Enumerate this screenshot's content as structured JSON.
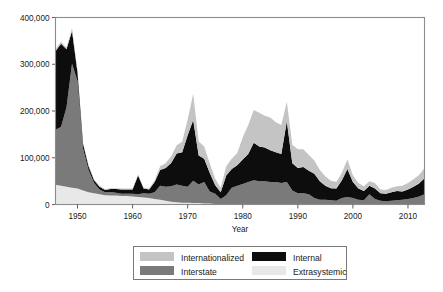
{
  "figure": {
    "background": "#ffffff",
    "width": 443,
    "height": 292
  },
  "chart_data": {
    "type": "area",
    "stacked": true,
    "title": "",
    "subtitle": "",
    "xlabel": "Year",
    "ylabel": "",
    "xlim": [
      1946,
      2013
    ],
    "ylim": [
      0,
      400000
    ],
    "grid": false,
    "legend_position": "bottom",
    "xticks": [
      1950,
      1960,
      1970,
      1980,
      1990,
      2000,
      2010
    ],
    "xtick_labels": [
      "1950",
      "1960",
      "1970",
      "1980",
      "1990",
      "2000",
      "2010"
    ],
    "yticks": [
      0,
      100000,
      200000,
      300000,
      400000
    ],
    "ytick_labels": [
      "0",
      "100,000",
      "200,000",
      "300,000",
      "400,000"
    ],
    "x": [
      1946,
      1947,
      1948,
      1949,
      1950,
      1951,
      1952,
      1953,
      1954,
      1955,
      1956,
      1957,
      1958,
      1959,
      1960,
      1961,
      1962,
      1963,
      1964,
      1965,
      1966,
      1967,
      1968,
      1969,
      1970,
      1971,
      1972,
      1973,
      1974,
      1975,
      1976,
      1977,
      1978,
      1979,
      1980,
      1981,
      1982,
      1983,
      1984,
      1985,
      1986,
      1987,
      1988,
      1989,
      1990,
      1991,
      1992,
      1993,
      1994,
      1995,
      1996,
      1997,
      1998,
      1999,
      2000,
      2001,
      2002,
      2003,
      2004,
      2005,
      2006,
      2007,
      2008,
      2009,
      2010,
      2011,
      2012,
      2013
    ],
    "series": [
      {
        "name": "Extrasystemic",
        "color": "#e8e8e8",
        "stack_order": 1,
        "values": [
          42000,
          40000,
          38000,
          36000,
          34000,
          30000,
          26000,
          24000,
          22000,
          20000,
          19000,
          19000,
          18000,
          18000,
          17000,
          16000,
          15000,
          14000,
          12000,
          10000,
          8000,
          6000,
          5000,
          4000,
          4000,
          3000,
          3000,
          2000,
          2000,
          1000,
          0,
          0,
          0,
          0,
          0,
          0,
          0,
          0,
          0,
          0,
          0,
          0,
          0,
          0,
          0,
          0,
          0,
          0,
          0,
          0,
          0,
          0,
          0,
          0,
          0,
          0,
          0,
          0,
          0,
          0,
          0,
          0,
          0,
          0,
          0,
          0,
          0,
          0
        ]
      },
      {
        "name": "Interstate",
        "color": "#7a7a7a",
        "stack_order": 2,
        "values": [
          118000,
          126000,
          170000,
          265000,
          230000,
          90000,
          48000,
          22000,
          10000,
          6000,
          8000,
          6000,
          5000,
          5000,
          6000,
          6000,
          9000,
          9000,
          14000,
          30000,
          30000,
          33000,
          38000,
          36000,
          34000,
          48000,
          40000,
          46000,
          26000,
          22000,
          12000,
          20000,
          36000,
          40000,
          44000,
          48000,
          52000,
          50000,
          50000,
          48000,
          48000,
          46000,
          48000,
          30000,
          24000,
          24000,
          22000,
          14000,
          10000,
          10000,
          9000,
          8000,
          14000,
          16000,
          14000,
          10000,
          9000,
          22000,
          12000,
          8000,
          7000,
          8000,
          9000,
          10000,
          12000,
          14000,
          17000,
          22000
        ]
      },
      {
        "name": "Internal",
        "color": "#0d0d0d",
        "stack_order": 3,
        "values": [
          168000,
          178000,
          124000,
          70000,
          18000,
          10000,
          8000,
          6000,
          6000,
          5000,
          6000,
          8000,
          9000,
          9000,
          9000,
          40000,
          10000,
          9000,
          22000,
          34000,
          40000,
          50000,
          66000,
          72000,
          110000,
          130000,
          62000,
          50000,
          40000,
          18000,
          14000,
          42000,
          40000,
          44000,
          52000,
          60000,
          80000,
          74000,
          72000,
          68000,
          64000,
          62000,
          130000,
          58000,
          54000,
          56000,
          50000,
          52000,
          40000,
          30000,
          26000,
          26000,
          38000,
          60000,
          34000,
          24000,
          20000,
          18000,
          22000,
          16000,
          16000,
          18000,
          20000,
          18000,
          20000,
          24000,
          28000,
          34000
        ]
      },
      {
        "name": "Internationalized",
        "color": "#c4c4c4",
        "stack_order": 4,
        "values": [
          4000,
          4000,
          4000,
          6000,
          4000,
          2000,
          2000,
          2000,
          2000,
          2000,
          2000,
          2000,
          2000,
          2000,
          2000,
          2000,
          2000,
          2000,
          4000,
          8000,
          10000,
          14000,
          18000,
          22000,
          34000,
          56000,
          30000,
          26000,
          20000,
          14000,
          10000,
          20000,
          22000,
          26000,
          48000,
          62000,
          70000,
          72000,
          68000,
          70000,
          64000,
          62000,
          42000,
          40000,
          40000,
          38000,
          34000,
          28000,
          24000,
          20000,
          16000,
          14000,
          16000,
          20000,
          14000,
          12000,
          10000,
          10000,
          12000,
          8000,
          8000,
          10000,
          10000,
          12000,
          14000,
          16000,
          18000,
          22000
        ]
      }
    ]
  },
  "legend": {
    "entries": [
      {
        "label": "Internationalized",
        "color": "#c4c4c4"
      },
      {
        "label": "Internal",
        "color": "#0d0d0d"
      },
      {
        "label": "Interstate",
        "color": "#7a7a7a"
      },
      {
        "label": "Extrasystemic",
        "color": "#e8e8e8"
      }
    ]
  }
}
